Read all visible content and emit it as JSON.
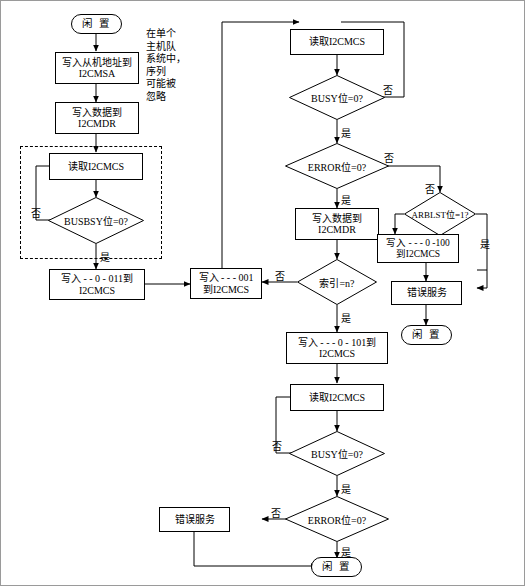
{
  "diagram": {
    "nodes": {
      "start_top": "闲 置",
      "write_slave_addr": "写入从机地址到\nI2CMSA",
      "write_data_1": "写入数据到\nI2CMDR",
      "read_mcs_1": "读取I2CMCS",
      "busbsy_check": "BUSBSY位=0?",
      "write_011": "写入 - - 0 - 011到\nI2CMCS",
      "write_001": "写入 - - - 001\n到I2CMCS",
      "read_mcs_2": "读取I2CMCS",
      "busy_check_1": "BUSY位=0?",
      "error_check_1": "ERROR位=0?",
      "write_data_2": "写入数据到\nI2CMDR",
      "index_check": "索引=n?",
      "arblst_check": "ARBLST位=1?",
      "write_100": "写入 - - - 0 -100\n到I2CMCS",
      "error_service_1": "错误服务",
      "idle_right": "闲 置",
      "write_101": "写入 - - - 0 - 101到\nI2CMCS",
      "read_mcs_3": "读取I2CMCS",
      "busy_check_2": "BUSY位=0?",
      "error_check_2": "ERROR位=0?",
      "error_service_2": "错误服务",
      "idle_bottom": "闲 置"
    },
    "note": "在单个\n主机队\n系统中，\n序列\n可能被\n忽略",
    "edge_labels": {
      "no_1": "否",
      "yes_1": "是",
      "no_2": "否",
      "yes_2": "是",
      "no_3": "否",
      "yes_3": "是",
      "yes_4": "是",
      "no_4": "否",
      "no_5": "否",
      "yes_5": "是",
      "no_6": "否",
      "yes_6": "是",
      "no_7": "否",
      "yes_7": "是"
    }
  }
}
